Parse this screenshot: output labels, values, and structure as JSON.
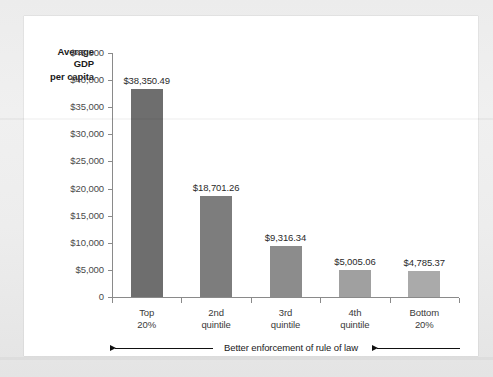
{
  "chart_data": {
    "type": "bar",
    "title": "",
    "categories": [
      "Top 20%",
      "2nd quintile",
      "3rd quintile",
      "4th quintile",
      "Bottom 20%"
    ],
    "category_lines": [
      [
        "Top",
        "20%"
      ],
      [
        "2nd",
        "quintile"
      ],
      [
        "3rd",
        "quintile"
      ],
      [
        "4th",
        "quintile"
      ],
      [
        "Bottom",
        "20%"
      ]
    ],
    "values": [
      38350.49,
      18701.26,
      9316.34,
      5005.06,
      4785.37
    ],
    "value_labels": [
      "$38,350.49",
      "$18,701.26",
      "$9,316.34",
      "$5,005.06",
      "$4,785.37"
    ],
    "bar_colors": [
      "#6e6e6e",
      "#7d7d7d",
      "#8c8c8c",
      "#a0a0a0",
      "#aaaaaa"
    ],
    "ylabel": "Average GDP per capita",
    "ylabel_lines": [
      "Average",
      "GDP",
      "per capita"
    ],
    "xlabel": "",
    "ylim": [
      0,
      45000
    ],
    "ytick_values": [
      45000,
      40000,
      35000,
      30000,
      25000,
      20000,
      15000,
      10000,
      5000,
      0
    ],
    "ytick_labels": [
      "$45,000",
      "$40,000",
      "$35,000",
      "$30,000",
      "$25,000",
      "$20,000",
      "$15,000",
      "$10,000",
      "$5,000",
      "0"
    ],
    "grid": false,
    "legend": null,
    "annotation": {
      "text": "Better enforcement of rule of law",
      "arrow_direction": "left",
      "arrow_count": 2
    }
  },
  "colors": {
    "page_background": "#ececec",
    "card_background": "#ffffff",
    "axis": "#8a8a8a",
    "text": "#2a2a2a",
    "tick_text": "#4a4a4a"
  }
}
